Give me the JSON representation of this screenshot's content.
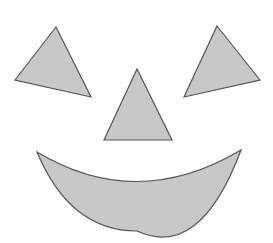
{
  "figure": {
    "background": "#ffffff",
    "fill_color": "#c8c8c8",
    "stroke_color": "#555555",
    "shapes": {
      "left_eye": {
        "type": "triangle",
        "points": "56,27 15,80 91,97"
      },
      "right_eye": {
        "type": "triangle",
        "points": "217,26 260,80 184,97"
      },
      "nose": {
        "type": "triangle",
        "points": "137,69 104,140 172,140"
      },
      "mouth": {
        "type": "crescent",
        "path": "M37,152 Q137,212 241,150 Q200,260 137,231 Q70,231 37,152 Z"
      }
    }
  }
}
